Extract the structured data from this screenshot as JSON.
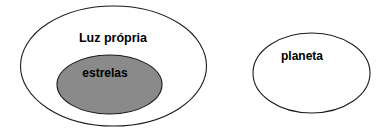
{
  "diagram": {
    "type": "venn-set-diagram",
    "background_color": "#ffffff",
    "stroke_color": "#1a1a1a",
    "text_color": "#000000",
    "sets": [
      {
        "id": "luz-propria",
        "label": "Luz própria",
        "fill": "#ffffff",
        "cx": 113.5,
        "cy": 66,
        "rx": 93,
        "ry": 60,
        "label_x": 113,
        "label_y": 39
      },
      {
        "id": "estrelas",
        "label": "estrelas",
        "fill": "#8a8a8a",
        "cx": 109.5,
        "cy": 84.5,
        "rx": 52.5,
        "ry": 29.5,
        "label_x": 105,
        "label_y": 74
      },
      {
        "id": "planeta",
        "label": "planeta",
        "fill": "#ffffff",
        "cx": 311.5,
        "cy": 73,
        "rx": 58.5,
        "ry": 40,
        "label_x": 302,
        "label_y": 57
      }
    ]
  }
}
